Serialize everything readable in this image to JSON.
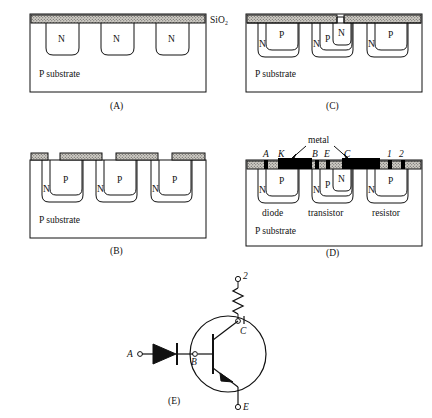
{
  "figure": {
    "panels": [
      {
        "id": "A",
        "caption": "(A)",
        "oxide_label": "SiO2",
        "oxide_label_display": "SiO₂",
        "substrate_label": "P substrate",
        "wells": [
          {
            "label": "N"
          },
          {
            "label": "N"
          },
          {
            "label": "N"
          }
        ]
      },
      {
        "id": "B",
        "caption": "(B)",
        "substrate_label": "P substrate",
        "wells": [
          {
            "outer_label": "N",
            "inner_label": "P"
          },
          {
            "outer_label": "N",
            "inner_label": "P"
          },
          {
            "outer_label": "N",
            "inner_label": "P"
          }
        ]
      },
      {
        "id": "C",
        "caption": "(C)",
        "substrate_label": "P substrate",
        "wells": [
          {
            "outer_label": "N",
            "inner_label": "P",
            "core_label": ""
          },
          {
            "outer_label": "N",
            "inner_label": "P",
            "core_label": "N"
          },
          {
            "outer_label": "N",
            "inner_label": "P",
            "core_label": ""
          }
        ]
      },
      {
        "id": "D",
        "caption": "(D)",
        "substrate_label": "P substrate",
        "metal_label": "metal",
        "wells": [
          {
            "outer_label": "N",
            "inner_label": "P",
            "core_label": "",
            "device": "diode"
          },
          {
            "outer_label": "N",
            "inner_label": "P",
            "core_label": "N",
            "device": "transistor"
          },
          {
            "outer_label": "N",
            "inner_label": "P",
            "core_label": "",
            "device": "resistor"
          }
        ],
        "terminals": [
          "A",
          "K",
          "B",
          "E",
          "C",
          "1",
          "2"
        ]
      },
      {
        "id": "E",
        "caption": "(E)",
        "terminals": {
          "anode": "A",
          "base": "B",
          "collector": "C",
          "emitter": "E",
          "node1": "1",
          "node2": "2"
        },
        "components": [
          "diode",
          "transistor",
          "resistor"
        ]
      }
    ]
  },
  "colors": {
    "line": "#111111",
    "oxide_fill": "#c9c6bf",
    "metal_fill": "#000000",
    "background": "#ffffff"
  }
}
